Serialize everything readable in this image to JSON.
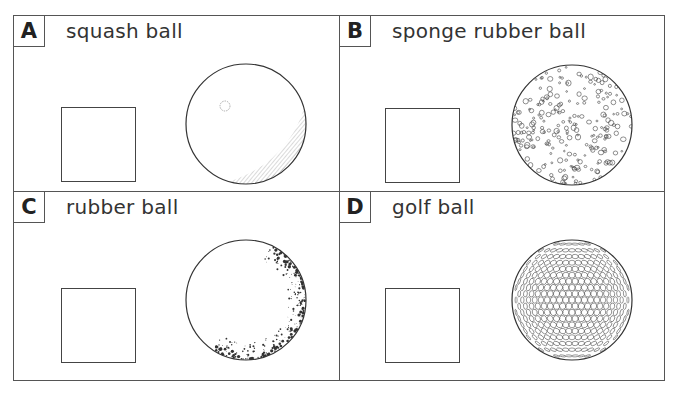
{
  "cards": [
    {
      "letter": "A",
      "label": "squash ball",
      "ball_icon": "squash-ball"
    },
    {
      "letter": "B",
      "label": "sponge rubber ball",
      "ball_icon": "sponge-rubber-ball"
    },
    {
      "letter": "C",
      "label": "rubber ball",
      "ball_icon": "rubber-ball"
    },
    {
      "letter": "D",
      "label": "golf ball",
      "ball_icon": "golf-ball"
    }
  ]
}
